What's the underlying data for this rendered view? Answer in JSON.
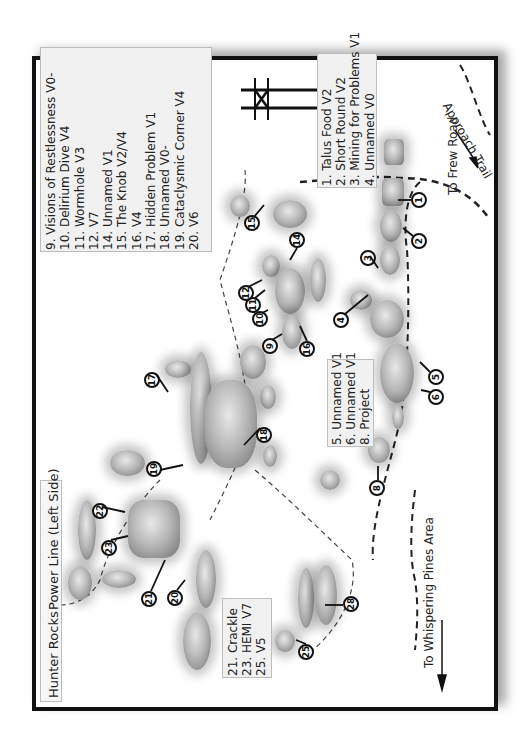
{
  "map": {
    "area_title": "Hunter Rocks",
    "area_subtitle": "Power Line (Left Side)",
    "directions": {
      "frew_road": "To Frew Road",
      "whispering_pines": "To Whispering Pines Area",
      "approach_trail": "Approach Trail"
    },
    "legend_1_4": [
      "1. Talus Food V2",
      "2. Short Round V2",
      "3. Mining for Problems V1",
      "4. Unnamed  V0"
    ],
    "legend_5_8": [
      "5. Unnamed V1",
      "6. Unnamed V1",
      "8. Project"
    ],
    "legend_9_20": [
      "9. Visions of Restlessness V0-",
      "10. Delirium Dive V4",
      "11. Wormhole V3",
      "12. V7",
      "14. Unnamed V1",
      "15. The Knob V2/V4",
      "16. V4",
      "17. Hidden Problem V1",
      "18. Unnamed V0-",
      "19. Cataclysmic Corner V4",
      "20. V6"
    ],
    "legend_21_25": [
      "21. Crackle",
      "23. HEMI V7",
      "25. V5"
    ],
    "markers": [
      {
        "n": "1",
        "x": 419,
        "y": 200
      },
      {
        "n": "2",
        "x": 419,
        "y": 241
      },
      {
        "n": "3",
        "x": 367,
        "y": 258
      },
      {
        "n": "4",
        "x": 340,
        "y": 320
      },
      {
        "n": "5",
        "x": 429,
        "y": 350
      },
      {
        "n": "6",
        "x": 429,
        "y": 370
      },
      {
        "n": "8",
        "x": 369,
        "y": 478
      },
      {
        "n": "9",
        "x": 277,
        "y": 330
      },
      {
        "n": "10",
        "x": 255,
        "y": 298
      },
      {
        "n": "11",
        "x": 245,
        "y": 290
      },
      {
        "n": "12",
        "x": 234,
        "y": 280
      },
      {
        "n": "14",
        "x": 291,
        "y": 236
      },
      {
        "n": "15",
        "x": 244,
        "y": 211
      },
      {
        "n": "16",
        "x": 307,
        "y": 331
      },
      {
        "n": "17",
        "x": 143,
        "y": 372
      },
      {
        "n": "18",
        "x": 256,
        "y": 427
      },
      {
        "n": "19",
        "x": 146,
        "y": 465
      },
      {
        "n": "20",
        "x": 167,
        "y": 590
      },
      {
        "n": "21",
        "x": 141,
        "y": 591
      },
      {
        "n": "22",
        "x": 92,
        "y": 507
      },
      {
        "n": "23",
        "x": 101,
        "y": 542
      },
      {
        "n": "25",
        "x": 306,
        "y": 643
      },
      {
        "n": "28",
        "x": 342,
        "y": 598
      }
    ]
  }
}
